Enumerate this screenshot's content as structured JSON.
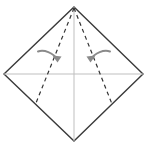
{
  "figure": {
    "type": "origami-fold-diagram",
    "canvas": {
      "width": 147,
      "height": 150,
      "background": "#ffffff"
    },
    "colors": {
      "outline": "#3a3a3a",
      "center_line": "#bfbfbf",
      "fold_line": "#333333",
      "arrow": "#8a8a8a",
      "paper_fill": "#ffffff"
    }
  },
  "shapes": {
    "paper_sheet": {
      "name": "square sheet rotated 45 degrees (diamond)",
      "points": "74,7 143,74 74,141 4,74",
      "stroke_width": 1.4
    },
    "center_lines": [
      {
        "name": "horizontal center crease",
        "x1": 4,
        "y1": 74,
        "x2": 143,
        "y2": 74,
        "stroke_width": 1
      },
      {
        "name": "vertical center crease",
        "x1": 74,
        "y1": 7,
        "x2": 74,
        "y2": 141,
        "stroke_width": 1
      }
    ],
    "fold_lines": [
      {
        "name": "left dashed valley fold",
        "x1": 74,
        "y1": 8,
        "x2": 36,
        "y2": 103,
        "dash": "4 3.5",
        "stroke_width": 1.2
      },
      {
        "name": "right dashed valley fold",
        "x1": 74,
        "y1": 8,
        "x2": 112,
        "y2": 104,
        "dash": "4 3.5",
        "stroke_width": 1.2
      }
    ],
    "arrows": [
      {
        "name": "left fold arrow",
        "path": "M 38 51.5 C 44 49.5, 53 52.5, 57.5 59.5",
        "head": "57.5,62.5 52.5,55.5 61.5,56.5",
        "stroke_width": 2.0,
        "direction": "curves right and down, indicating left flap folds inward to center"
      },
      {
        "name": "right fold arrow",
        "path": "M 110 51.5 C 104 49.5, 95 52.5, 90.5 59.5",
        "head": "90.5,62.5 86.5,56.5 95.5,55.5",
        "stroke_width": 2.0,
        "direction": "curves left and down, indicating right flap folds inward to center"
      }
    ]
  }
}
